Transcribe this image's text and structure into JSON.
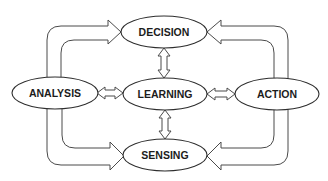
{
  "diagram": {
    "type": "cycle-flow",
    "nodes": {
      "decision": {
        "label": "DECISION",
        "cx": 164,
        "cy": 32,
        "rx": 43,
        "ry": 16
      },
      "analysis": {
        "label": "ANALYSIS",
        "cx": 55,
        "cy": 93,
        "rx": 43,
        "ry": 16
      },
      "learning": {
        "label": "LEARNING",
        "cx": 165,
        "cy": 94,
        "rx": 42,
        "ry": 16
      },
      "action": {
        "label": "ACTION",
        "cx": 277,
        "cy": 94,
        "rx": 42,
        "ry": 16
      },
      "sensing": {
        "label": "SENSING",
        "cx": 165,
        "cy": 155,
        "rx": 42,
        "ry": 16
      }
    },
    "edges": [
      {
        "from": "analysis",
        "to": "decision",
        "style": "hollow-curved-arrow"
      },
      {
        "from": "action",
        "to": "decision",
        "style": "hollow-curved-arrow"
      },
      {
        "from": "analysis",
        "to": "sensing",
        "style": "hollow-curved-arrow"
      },
      {
        "from": "action",
        "to": "sensing",
        "style": "hollow-curved-arrow"
      },
      {
        "from": "decision",
        "to": "learning",
        "style": "hollow-double-arrow"
      },
      {
        "from": "sensing",
        "to": "learning",
        "style": "hollow-double-arrow"
      },
      {
        "from": "analysis",
        "to": "learning",
        "style": "hollow-double-arrow"
      },
      {
        "from": "action",
        "to": "learning",
        "style": "hollow-double-arrow"
      }
    ],
    "colors": {
      "stroke": "#2e2e2e",
      "arrow_stroke": "#4a4a4a",
      "fill": "#ffffff",
      "text": "#1c1c1c"
    }
  }
}
